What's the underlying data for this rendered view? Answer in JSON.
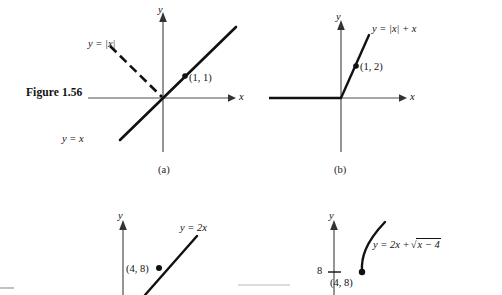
{
  "figure": {
    "caption_label": "Figure 1.56",
    "background": "#ffffff",
    "ink": "#111111",
    "axis_color": "#4d4d4d"
  },
  "panels": [
    {
      "id": "a",
      "sublabel": "(a)",
      "axis_x_name": "x",
      "axis_y_name": "y",
      "curves": [
        {
          "name": "y-equals-abs-x-left-branch",
          "style": "dashed",
          "label": "y = |x|"
        },
        {
          "name": "y-equals-x-line",
          "style": "solid",
          "label": "y = x"
        }
      ],
      "point_label": "(1, 1)"
    },
    {
      "id": "b",
      "sublabel": "(b)",
      "axis_x_name": "x",
      "axis_y_name": "y",
      "curves": [
        {
          "name": "y-equals-abs-x-plus-x",
          "style": "solid",
          "label": "y = |x| + x"
        }
      ],
      "point_label": "(1, 2)"
    },
    {
      "id": "c",
      "sublabel": "",
      "axis_x_name": "",
      "axis_y_name": "y",
      "curves": [
        {
          "name": "y-equals-2x",
          "style": "solid",
          "label": "y = 2x"
        }
      ],
      "point_label": "(4, 8)"
    },
    {
      "id": "d",
      "sublabel": "",
      "axis_x_name": "",
      "axis_y_name": "y",
      "curves": [
        {
          "name": "y-equals-2x-plus-sqrt-x-minus-4",
          "style": "solid",
          "label": "y = 2x + √(x − 4)"
        }
      ],
      "point_label": "(4, 8)",
      "y_tick_label": "8"
    }
  ],
  "labels": {
    "a_curve_abs": "y = |x|",
    "a_curve_line": "y = x",
    "a_point": "(1, 1)",
    "a_axis_x": "x",
    "a_axis_y": "y",
    "a_sub": "(a)",
    "b_curve": "y = |x| + x",
    "b_point": "(1, 2)",
    "b_axis_x": "x",
    "b_axis_y": "y",
    "b_sub": "(b)",
    "c_curve": "y = 2x",
    "c_point": "(4, 8)",
    "c_axis_y": "y",
    "d_curve_prefix": "y = 2x +",
    "d_curve_radicand": "x − 4",
    "d_point": "(4, 8)",
    "d_axis_y": "y",
    "d_tick": "8"
  }
}
